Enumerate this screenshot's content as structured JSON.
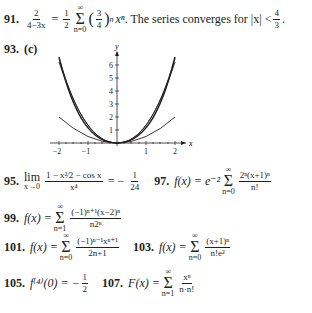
{
  "problems": {
    "p91": {
      "number": "91.",
      "lhs_num": "2",
      "lhs_den": "4−3x",
      "eq": "=",
      "coef_num": "1",
      "coef_den": "2",
      "sum_top": "∞",
      "sum_bot": "n=0",
      "ratio_num": "3",
      "ratio_den": "4",
      "term": "xⁿ",
      "sentence": ". The series converges for |x| <",
      "bound_num": "4",
      "bound_den": "3",
      "end": "."
    },
    "p93": {
      "number": "93.",
      "part": "(c)"
    },
    "p95": {
      "number": "95.",
      "lim": "lim",
      "lim_sub": "x→0",
      "num": "1 − x²⁄2 − cos x",
      "den": "x⁴",
      "eq": "= −",
      "res_num": "1",
      "res_den": "24"
    },
    "p97": {
      "number": "97.",
      "lhs": "f(x) = e⁻²",
      "sum_top": "∞",
      "sum_bot": "n=0",
      "num": "2ⁿ(x+1)ⁿ",
      "den": "n!"
    },
    "p99": {
      "number": "99.",
      "lhs": "f(x) =",
      "sum_top": "∞",
      "sum_bot": "n=1",
      "num": "(−1)ⁿ⁺¹(x−2)ⁿ",
      "den": "n2ⁿ"
    },
    "p101": {
      "number": "101.",
      "lhs": "f(x) =",
      "sum_top": "∞",
      "sum_bot": "n=0",
      "num": "(−1)ⁿ⁻¹xⁿ⁺¹",
      "den": "2n+1"
    },
    "p103": {
      "number": "103.",
      "lhs": "f(x) =",
      "sum_top": "∞",
      "sum_bot": "n=0",
      "num": "(x+1)ⁿ",
      "den": "n!e²"
    },
    "p105": {
      "number": "105.",
      "lhs": "f⁽⁴⁾(0) = −",
      "res_num": "1",
      "res_den": "2"
    },
    "p107": {
      "number": "107.",
      "lhs": "F(x) =",
      "sum_top": "∞",
      "sum_bot": "n=1",
      "num": "xⁿ",
      "den": "n·n!"
    }
  },
  "graph": {
    "x_label": "x",
    "y_label": "y",
    "x_ticks": [
      "−2",
      "−1",
      "1",
      "2"
    ],
    "y_ticks": [
      "1",
      "2",
      "3",
      "4",
      "5",
      "6"
    ]
  }
}
